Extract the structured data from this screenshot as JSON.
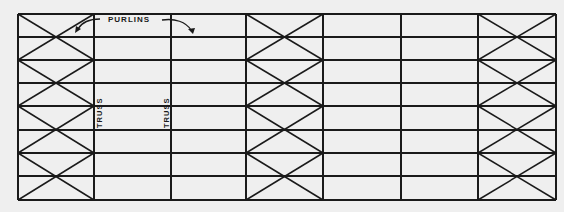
{
  "diagram": {
    "colors": {
      "background": "#efefef",
      "line": "#1a1a1a"
    },
    "frame": {
      "x_lines": [
        18,
        94,
        171,
        246,
        323,
        401,
        478,
        556
      ],
      "y_lines": [
        14,
        37,
        60,
        83,
        106,
        130,
        153,
        176,
        200
      ]
    },
    "braced_bays": [
      0,
      3,
      6
    ],
    "labels": {
      "purlins": "PURLINS",
      "truss_1": "TRUSS",
      "truss_2": "TRUSS"
    }
  }
}
